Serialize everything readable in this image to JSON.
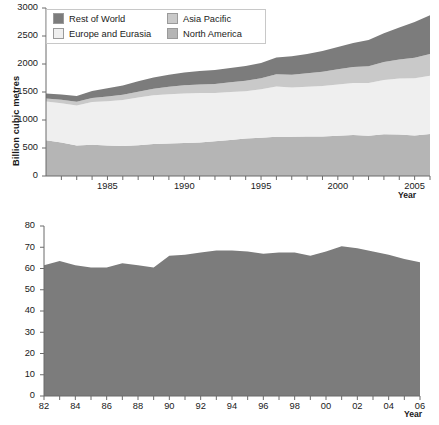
{
  "figure": {
    "background": "#ffffff",
    "text_color": "#1a1a1a"
  },
  "colors": {
    "rest_of_world": "#7c7c7c",
    "asia_pacific": "#c9c9c9",
    "europe_and_eurasia": "#efefef",
    "north_america": "#b5b5b5",
    "world": "#7c7c7c",
    "axis": "#6b6b6b",
    "legend_border": "#c8c8c8"
  },
  "top_chart": {
    "ylabel": "Billion cubic metres",
    "xlabel": "Year",
    "yticks": [
      "0",
      "500",
      "1000",
      "1500",
      "2000",
      "2500",
      "3000"
    ],
    "xticks": [
      "1985",
      "1990",
      "1995",
      "2000",
      "2005"
    ],
    "legend": [
      {
        "label": "Rest of World",
        "color_key": "rest_of_world"
      },
      {
        "label": "Asia Pacific",
        "color_key": "asia_pacific"
      },
      {
        "label": "Europe and Eurasia",
        "color_key": "europe_and_eurasia"
      },
      {
        "label": "North America",
        "color_key": "north_america"
      }
    ]
  },
  "bottom_chart": {
    "ylabel": "Reserves to production (R/P) rate",
    "xlabel": "Year",
    "yticks": [
      "0",
      "10",
      "20",
      "30",
      "40",
      "50",
      "60",
      "70",
      "80"
    ],
    "xticks": [
      "82",
      "84",
      "86",
      "88",
      "90",
      "92",
      "94",
      "96",
      "98",
      "00",
      "02",
      "04",
      "06"
    ],
    "legend": [
      {
        "label": "World",
        "color_key": "world"
      }
    ]
  },
  "chart_data": [
    {
      "type": "area",
      "id": "world-natural-gas-production",
      "title": "",
      "xlabel": "Year",
      "ylabel": "Billion cubic metres",
      "stacked": true,
      "grid": false,
      "legend_position": "top-left",
      "xlim": [
        1981,
        2006
      ],
      "ylim": [
        0,
        3000
      ],
      "yticks": [
        0,
        500,
        1000,
        1500,
        2000,
        2500,
        3000
      ],
      "xticks": [
        1985,
        1990,
        1995,
        2000,
        2005
      ],
      "x": [
        1981,
        1982,
        1983,
        1984,
        1985,
        1986,
        1987,
        1988,
        1989,
        1990,
        1991,
        1992,
        1993,
        1994,
        1995,
        1996,
        1997,
        1998,
        1999,
        2000,
        2001,
        2002,
        2003,
        2004,
        2005,
        2006
      ],
      "series": [
        {
          "name": "North America",
          "color": "#b5b5b5",
          "values": [
            640,
            600,
            545,
            560,
            545,
            535,
            550,
            570,
            580,
            590,
            600,
            620,
            645,
            670,
            685,
            700,
            700,
            705,
            705,
            720,
            730,
            720,
            745,
            740,
            725,
            750
          ]
        },
        {
          "name": "Europe and Eurasia",
          "color": "#efefef",
          "values": [
            690,
            700,
            715,
            760,
            790,
            820,
            850,
            870,
            880,
            885,
            880,
            860,
            855,
            845,
            865,
            900,
            880,
            890,
            900,
            915,
            930,
            940,
            970,
            1000,
            1020,
            1040
          ]
        },
        {
          "name": "Asia Pacific",
          "color": "#c9c9c9",
          "values": [
            55,
            60,
            65,
            75,
            85,
            95,
            105,
            120,
            135,
            145,
            155,
            165,
            175,
            185,
            195,
            215,
            230,
            240,
            255,
            270,
            285,
            300,
            320,
            340,
            365,
            390
          ]
        },
        {
          "name": "Rest of World",
          "color": "#7c7c7c",
          "values": [
            90,
            95,
            105,
            125,
            145,
            165,
            185,
            200,
            215,
            230,
            240,
            250,
            255,
            265,
            275,
            300,
            330,
            345,
            370,
            400,
            430,
            470,
            515,
            570,
            640,
            690
          ]
        }
      ],
      "totals": [
        1475,
        1455,
        1430,
        1520,
        1565,
        1615,
        1690,
        1760,
        1810,
        1850,
        1875,
        1895,
        1930,
        1965,
        2020,
        2115,
        2140,
        2180,
        2230,
        2305,
        2375,
        2430,
        2550,
        2650,
        2750,
        2870
      ]
    },
    {
      "type": "area",
      "id": "world-reserves-to-production-rate",
      "title": "",
      "xlabel": "Year",
      "ylabel": "Reserves to production (R/P) rate",
      "stacked": false,
      "grid": false,
      "legend_position": "top-left",
      "xlim": [
        1982,
        2006
      ],
      "ylim": [
        0,
        80
      ],
      "yticks": [
        0,
        10,
        20,
        30,
        40,
        50,
        60,
        70,
        80
      ],
      "xticks": [
        1982,
        1984,
        1986,
        1988,
        1990,
        1992,
        1994,
        1996,
        1998,
        2000,
        2002,
        2004,
        2006
      ],
      "x": [
        1982,
        1983,
        1984,
        1985,
        1986,
        1987,
        1988,
        1989,
        1990,
        1991,
        1992,
        1993,
        1994,
        1995,
        1996,
        1997,
        1998,
        1999,
        2000,
        2001,
        2002,
        2003,
        2004,
        2005,
        2006
      ],
      "series": [
        {
          "name": "World",
          "color": "#7c7c7c",
          "values": [
            61.5,
            63.5,
            61.5,
            60.5,
            60.5,
            62.5,
            61.5,
            60.5,
            66.0,
            66.5,
            67.5,
            68.5,
            68.5,
            68.0,
            67.0,
            67.5,
            67.5,
            66.0,
            68.0,
            70.5,
            69.5,
            68.0,
            66.5,
            64.5,
            63.0
          ]
        }
      ]
    }
  ]
}
